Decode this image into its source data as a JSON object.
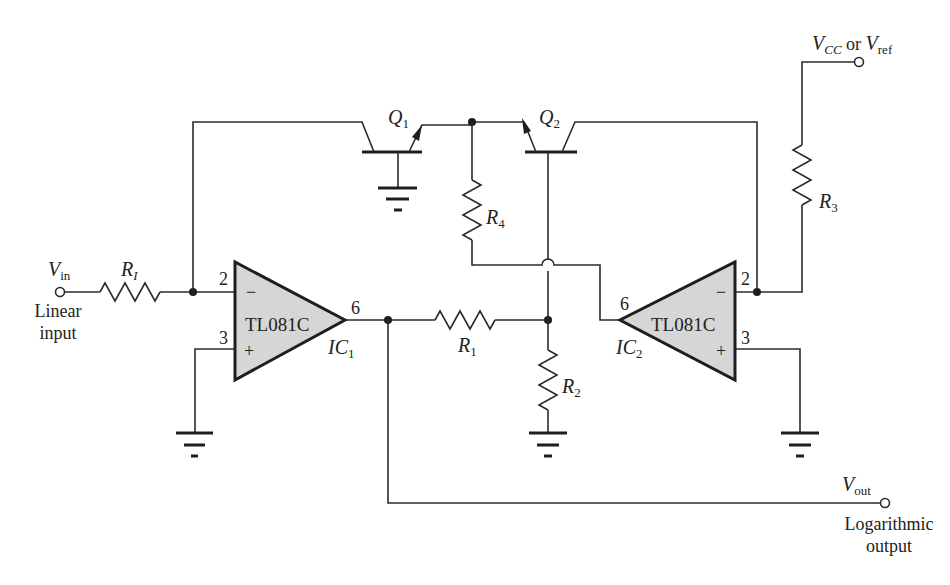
{
  "diagram": {
    "input": {
      "symbol_main": "V",
      "symbol_sub": "in",
      "caption_line1": "Linear",
      "caption_line2": "input"
    },
    "output": {
      "symbol_main": "V",
      "symbol_sub": "out",
      "caption_line1": "Logarithmic",
      "caption_line2": "output"
    },
    "supply": {
      "symbol1_main": "V",
      "symbol1_sub": "CC",
      "connector": " or ",
      "symbol2_main": "V",
      "symbol2_sub": "ref"
    },
    "resistors": [
      {
        "main": "R",
        "sub": "I"
      },
      {
        "main": "R",
        "sub": "1"
      },
      {
        "main": "R",
        "sub": "2"
      },
      {
        "main": "R",
        "sub": "3"
      },
      {
        "main": "R",
        "sub": "4"
      }
    ],
    "transistors": [
      {
        "main": "Q",
        "sub": "1"
      },
      {
        "main": "Q",
        "sub": "2"
      }
    ],
    "opamps": [
      {
        "part": "TL081C",
        "ref_main": "IC",
        "ref_sub": "1",
        "pin_inverting": "2",
        "pin_noninverting": "3",
        "pin_output": "6",
        "minus": "−",
        "plus": "+"
      },
      {
        "part": "TL081C",
        "ref_main": "IC",
        "ref_sub": "2",
        "pin_inverting": "2",
        "pin_noninverting": "3",
        "pin_output": "6",
        "minus": "−",
        "plus": "+"
      }
    ],
    "colors": {
      "line": "#2b2b2b",
      "opamp_fill": "#d6d6d6",
      "background": "#ffffff"
    }
  }
}
